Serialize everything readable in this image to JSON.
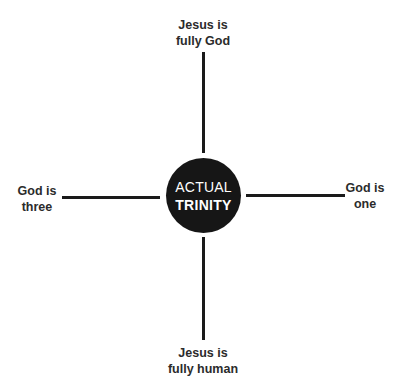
{
  "diagram": {
    "center": {
      "line1": "ACTUAL",
      "line2": "TRINITY",
      "fill": "#161616",
      "text_color": "#ffffff"
    },
    "top": {
      "line1": "Jesus is",
      "line2": "fully God"
    },
    "bottom": {
      "line1": "Jesus is",
      "line2": "fully human"
    },
    "left": {
      "line1": "God is",
      "line2": "three"
    },
    "right": {
      "line1": "God is",
      "line2": "one"
    },
    "line_color": "#1a1a1a",
    "label_color": "#2b2b2b"
  }
}
